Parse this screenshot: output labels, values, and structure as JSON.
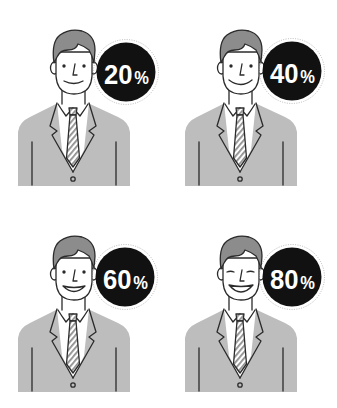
{
  "figures": [
    {
      "value": "20",
      "unit": "%",
      "expression": "slight smile"
    },
    {
      "value": "40",
      "unit": "%",
      "expression": "smile"
    },
    {
      "value": "60",
      "unit": "%",
      "expression": "open smile"
    },
    {
      "value": "80",
      "unit": "%",
      "expression": "big grin with closed eyes"
    }
  ],
  "colors": {
    "badge": "#111111",
    "badge_ring": "#a8a8a8",
    "jacket": "#bdbdbd",
    "hair": "#8c8c8c",
    "outline": "#2b2b2b",
    "shirt": "#ffffff"
  }
}
